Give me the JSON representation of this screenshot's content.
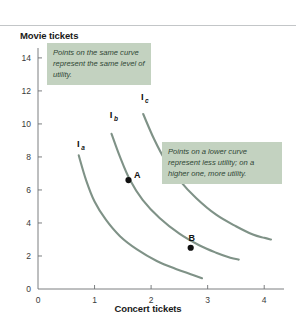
{
  "figure": {
    "background_color": "#ffffff",
    "rule_color": "#c3c6c8"
  },
  "annotations": [
    {
      "id": "same-curve",
      "text": "Points on the same curve represent the same level of utility.",
      "fill_color": "#c3d2c0",
      "text_color": "#2f4635"
    },
    {
      "id": "lower-curve",
      "text": "Points on a lower curve represent less utility; on a higher one, more utility.",
      "fill_color": "#c3d2c0",
      "text_color": "#2f4635"
    }
  ],
  "chart_data": {
    "type": "line",
    "title": "",
    "xlabel": "Concert tickets",
    "ylabel": "Movie tickets",
    "xlim": [
      0,
      4.35
    ],
    "ylim": [
      0,
      14.6
    ],
    "xticks": [
      "0",
      "1",
      "2",
      "3",
      "4"
    ],
    "xtick_values": [
      0,
      1,
      2,
      3,
      4
    ],
    "yticks": [
      "0",
      "2",
      "4",
      "6",
      "8",
      "10",
      "12",
      "14"
    ],
    "ytick_values": [
      0,
      2,
      4,
      6,
      8,
      10,
      12,
      14
    ],
    "grid": false,
    "legend": "none",
    "curve_color": "#7f9287",
    "series": [
      {
        "name": "Ia",
        "label": "I",
        "subscript": "a",
        "label_x": 0.69,
        "label_y": 8.6,
        "x": [
          0.72,
          0.85,
          1.0,
          1.2,
          1.45,
          1.75,
          2.1,
          2.45,
          2.7,
          2.9
        ],
        "y": [
          8.1,
          6.6,
          5.3,
          4.2,
          3.2,
          2.4,
          1.7,
          1.2,
          0.9,
          0.65
        ]
      },
      {
        "name": "Ib",
        "label": "I",
        "subscript": "b",
        "label_x": 1.27,
        "label_y": 10.35,
        "x": [
          1.3,
          1.45,
          1.62,
          1.85,
          2.15,
          2.5,
          2.85,
          3.15,
          3.4,
          3.55
        ],
        "y": [
          9.4,
          8.0,
          6.65,
          5.4,
          4.3,
          3.35,
          2.65,
          2.2,
          1.9,
          1.78
        ]
      },
      {
        "name": "Ic",
        "label": "I",
        "subscript": "c",
        "label_x": 1.82,
        "label_y": 11.45,
        "x": [
          1.86,
          2.05,
          2.25,
          2.5,
          2.8,
          3.15,
          3.5,
          3.8,
          4.0,
          4.12
        ],
        "y": [
          10.6,
          9.1,
          7.8,
          6.6,
          5.5,
          4.5,
          3.8,
          3.3,
          3.1,
          3.0
        ]
      }
    ],
    "points": [
      {
        "name": "A",
        "label": "A",
        "x": 1.6,
        "y": 6.6,
        "on_curve": "Ib"
      },
      {
        "name": "B",
        "label": "B",
        "x": 2.7,
        "y": 2.5,
        "on_curve": "Ib"
      }
    ]
  }
}
